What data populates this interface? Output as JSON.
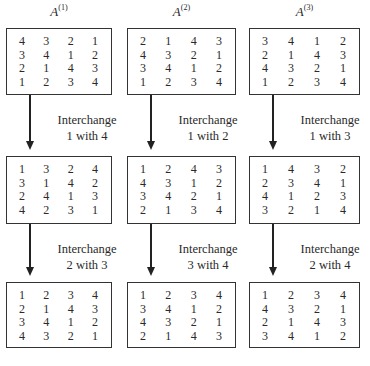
{
  "columns": [
    {
      "title": "A",
      "superscript": "(1)",
      "matrices": [
        [
          [
            4,
            3,
            2,
            1
          ],
          [
            3,
            4,
            1,
            2
          ],
          [
            2,
            1,
            4,
            3
          ],
          [
            1,
            2,
            3,
            4
          ]
        ],
        [
          [
            1,
            3,
            2,
            4
          ],
          [
            3,
            1,
            4,
            2
          ],
          [
            2,
            4,
            1,
            3
          ],
          [
            4,
            2,
            3,
            1
          ]
        ],
        [
          [
            1,
            2,
            3,
            4
          ],
          [
            2,
            1,
            4,
            3
          ],
          [
            3,
            4,
            1,
            2
          ],
          [
            4,
            3,
            2,
            1
          ]
        ]
      ],
      "steps": [
        {
          "line1": "Interchange",
          "line2": "1 with 4"
        },
        {
          "line1": "Interchange",
          "line2": "2 with 3"
        }
      ]
    },
    {
      "title": "A",
      "superscript": "(2)",
      "matrices": [
        [
          [
            2,
            1,
            4,
            3
          ],
          [
            4,
            3,
            2,
            1
          ],
          [
            3,
            4,
            1,
            2
          ],
          [
            1,
            2,
            3,
            4
          ]
        ],
        [
          [
            1,
            2,
            4,
            3
          ],
          [
            4,
            3,
            1,
            2
          ],
          [
            3,
            4,
            2,
            1
          ],
          [
            2,
            1,
            3,
            4
          ]
        ],
        [
          [
            1,
            2,
            3,
            4
          ],
          [
            3,
            4,
            1,
            2
          ],
          [
            4,
            3,
            2,
            1
          ],
          [
            2,
            1,
            4,
            3
          ]
        ]
      ],
      "steps": [
        {
          "line1": "Interchange",
          "line2": "1 with 2"
        },
        {
          "line1": "Interchange",
          "line2": "3 with 4"
        }
      ]
    },
    {
      "title": "A",
      "superscript": "(3)",
      "matrices": [
        [
          [
            3,
            4,
            1,
            2
          ],
          [
            2,
            1,
            4,
            3
          ],
          [
            4,
            3,
            2,
            1
          ],
          [
            1,
            2,
            3,
            4
          ]
        ],
        [
          [
            1,
            4,
            3,
            2
          ],
          [
            2,
            3,
            4,
            1
          ],
          [
            4,
            1,
            2,
            3
          ],
          [
            3,
            2,
            1,
            4
          ]
        ],
        [
          [
            1,
            2,
            3,
            4
          ],
          [
            4,
            3,
            2,
            1
          ],
          [
            2,
            1,
            4,
            3
          ],
          [
            3,
            4,
            1,
            2
          ]
        ]
      ],
      "steps": [
        {
          "line1": "Interchange",
          "line2": "1 with 3"
        },
        {
          "line1": "Interchange",
          "line2": "2 with 4"
        }
      ]
    }
  ]
}
